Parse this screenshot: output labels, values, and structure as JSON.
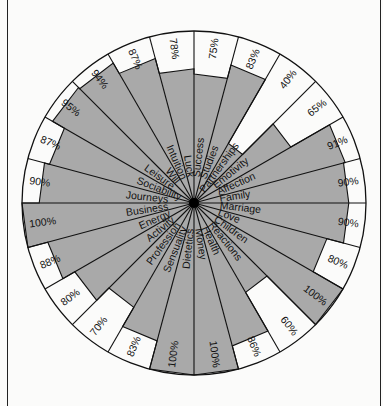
{
  "chart_data": {
    "type": "radar",
    "title": "",
    "layout": {
      "center": [
        194,
        203
      ],
      "radius": 172,
      "sectors": 24,
      "start_angle_deg": 0,
      "direction": "clockwise",
      "fill_color": "#a9a9a9",
      "line_color": "#111111",
      "background": "#fbfbfa"
    },
    "categories": [
      "Success",
      "Studies",
      "Partnerships",
      "Emotivity",
      "Affection",
      "Family",
      "Marriage",
      "Love",
      "Children",
      "Reactions",
      "Health",
      "Money",
      "Dietetics",
      "Sensuality",
      "Profession",
      "Activity",
      "Energy",
      "Business",
      "Journeys",
      "Sociability",
      "Leisure",
      "Will",
      "Intuition",
      "Luck"
    ],
    "values": [
      75,
      83,
      40,
      65,
      91,
      90,
      90,
      80,
      100,
      60,
      86,
      100,
      100,
      83,
      70,
      80,
      88,
      100,
      90,
      87,
      95,
      94,
      87,
      78
    ],
    "value_labels": [
      "75%",
      "83%",
      "40%",
      "65%",
      "91%",
      "90%",
      "90%",
      "80%",
      "100%",
      "60%",
      "86%",
      "100%",
      "100%",
      "83%",
      "70%",
      "80%",
      "88%",
      "100%",
      "90%",
      "87%",
      "95%",
      "94%",
      "87%",
      "78%"
    ],
    "ylim": [
      0,
      100
    ]
  }
}
